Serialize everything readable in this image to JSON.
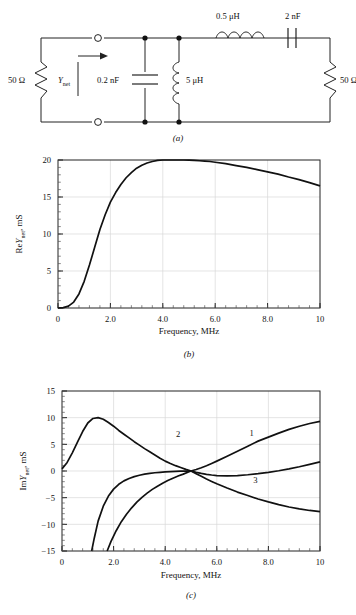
{
  "figure": {
    "panels": [
      {
        "id": "a",
        "caption": "(a)",
        "type": "circuit"
      },
      {
        "id": "b",
        "caption": "(b)",
        "type": "chart"
      },
      {
        "id": "c",
        "caption": "(c)",
        "type": "chart"
      }
    ]
  },
  "circuit": {
    "source_resistor_label": "50 Ω",
    "load_resistor_label": "50 Ω",
    "admittance_label": "Y",
    "admittance_sub": "net",
    "cap_shunt_label": "0.2 nF",
    "inductor_shunt_label": "5 μH",
    "inductor_series_label": "0.5 μH",
    "cap_series_label": "2 nF",
    "terminal_top": "terminal",
    "terminal_bottom": "terminal"
  },
  "chart_data": [
    {
      "panel": "b",
      "type": "line",
      "title": "",
      "xlabel": "Frequency, MHz",
      "ylabel_prefix": "Re",
      "ylabel_sym": "Y",
      "ylabel_sub": "net",
      "ylabel_units": ", mS",
      "ylabel": "Re Ynet, mS",
      "xlim": [
        0,
        10
      ],
      "ylim": [
        0,
        20
      ],
      "xticks": [
        0,
        2,
        4,
        6,
        8,
        10
      ],
      "xticklabels": [
        "0",
        "2.0",
        "4.0",
        "6.0",
        "8.0",
        "10"
      ],
      "yticks": [
        0,
        5,
        10,
        15,
        20
      ],
      "yticklabels": [
        "0",
        "5",
        "10",
        "15",
        "20"
      ],
      "grid": true,
      "minor_ticks": true,
      "series": [
        {
          "name": "ReYnet",
          "x": [
            0.0,
            0.2,
            0.4,
            0.6,
            0.8,
            1.0,
            1.2,
            1.4,
            1.6,
            1.8,
            2.0,
            2.2,
            2.4,
            2.6,
            2.8,
            3.0,
            3.2,
            3.4,
            3.6,
            3.8,
            4.0,
            4.2,
            4.4,
            4.6,
            4.8,
            5.0,
            5.2,
            5.4,
            5.6,
            5.8,
            6.0,
            6.4,
            6.8,
            7.2,
            7.6,
            8.0,
            8.4,
            8.8,
            9.2,
            9.6,
            10.0
          ],
          "y": [
            0.0,
            0.05,
            0.25,
            0.8,
            1.9,
            3.6,
            5.8,
            8.2,
            10.6,
            12.6,
            14.3,
            15.6,
            16.7,
            17.6,
            18.3,
            18.9,
            19.3,
            19.6,
            19.8,
            19.95,
            20.0,
            20.0,
            20.0,
            20.0,
            20.0,
            19.98,
            19.95,
            19.9,
            19.85,
            19.8,
            19.7,
            19.5,
            19.25,
            19.0,
            18.7,
            18.4,
            18.1,
            17.7,
            17.35,
            16.95,
            16.5
          ]
        }
      ]
    },
    {
      "panel": "c",
      "type": "line",
      "title": "",
      "xlabel": "Frequency, MHz",
      "ylabel_prefix": "Im",
      "ylabel_sym": "Y",
      "ylabel_sub": "net",
      "ylabel_units": ", mS",
      "ylabel": "Im Ynet, mS",
      "xlim": [
        0,
        10
      ],
      "ylim": [
        -15,
        15
      ],
      "xticks": [
        0,
        2,
        4,
        6,
        8,
        10
      ],
      "xticklabels": [
        "0",
        "2.0",
        "4.0",
        "6.0",
        "8.0",
        "10"
      ],
      "yticks": [
        -15,
        -10,
        -5,
        0,
        5,
        10,
        15
      ],
      "yticklabels": [
        "−15",
        "−10",
        "−5",
        "0",
        "5",
        "10",
        "15"
      ],
      "grid": true,
      "minor_ticks": true,
      "annotations": [
        {
          "text": "1",
          "x": 7.35,
          "y": 6.6
        },
        {
          "text": "2",
          "x": 4.5,
          "y": 6.4
        },
        {
          "text": "3",
          "x": 7.5,
          "y": -2.2
        }
      ],
      "series": [
        {
          "name": "1",
          "x": [
            1.15,
            1.25,
            1.4,
            1.6,
            1.8,
            2.0,
            2.2,
            2.4,
            2.6,
            2.8,
            3.0,
            3.2,
            3.4,
            3.6,
            3.8,
            4.0,
            4.2,
            4.4,
            4.6,
            4.8,
            5.0,
            5.2,
            5.4,
            5.6,
            5.8,
            6.0,
            6.4,
            6.8,
            7.2,
            7.6,
            8.0,
            8.4,
            8.8,
            9.2,
            9.6,
            10.0
          ],
          "y": [
            -15.0,
            -12.6,
            -9.4,
            -6.6,
            -4.7,
            -3.4,
            -2.5,
            -1.85,
            -1.4,
            -1.05,
            -0.8,
            -0.6,
            -0.45,
            -0.33,
            -0.24,
            -0.16,
            -0.1,
            -0.06,
            -0.03,
            -0.01,
            0.0,
            0.28,
            0.62,
            1.0,
            1.42,
            1.85,
            2.75,
            3.7,
            4.65,
            5.6,
            6.35,
            7.1,
            7.8,
            8.4,
            8.9,
            9.3
          ]
        },
        {
          "name": "2",
          "x": [
            0.0,
            0.2,
            0.4,
            0.6,
            0.8,
            1.0,
            1.2,
            1.4,
            1.6,
            1.8,
            2.0,
            2.2,
            2.4,
            2.6,
            2.8,
            3.0,
            3.2,
            3.4,
            3.6,
            3.8,
            4.0,
            4.2,
            4.4,
            4.6,
            4.8,
            5.0,
            5.2,
            5.4,
            5.6,
            5.8,
            6.0,
            6.4,
            6.8,
            7.2,
            7.6,
            8.0,
            8.4,
            8.8,
            9.2,
            9.6,
            10.0
          ],
          "y": [
            0.4,
            1.6,
            3.4,
            5.4,
            7.4,
            9.0,
            9.85,
            10.0,
            9.7,
            9.1,
            8.4,
            7.6,
            6.9,
            6.2,
            5.5,
            4.85,
            4.2,
            3.6,
            3.0,
            2.4,
            1.85,
            1.4,
            1.0,
            0.65,
            0.3,
            0.0,
            -0.25,
            -0.45,
            -0.62,
            -0.75,
            -0.85,
            -0.9,
            -0.85,
            -0.7,
            -0.5,
            -0.25,
            0.05,
            0.4,
            0.8,
            1.25,
            1.7
          ]
        },
        {
          "name": "3",
          "x": [
            1.75,
            1.9,
            2.1,
            2.3,
            2.5,
            2.7,
            2.9,
            3.1,
            3.3,
            3.5,
            3.7,
            3.9,
            4.1,
            4.3,
            4.5,
            4.7,
            4.9,
            5.0,
            5.2,
            5.4,
            5.6,
            5.8,
            6.0,
            6.4,
            6.8,
            7.2,
            7.6,
            8.0,
            8.4,
            8.8,
            9.2,
            9.6,
            10.0
          ],
          "y": [
            -15.0,
            -13.2,
            -11.2,
            -9.5,
            -8.1,
            -6.9,
            -5.85,
            -4.95,
            -4.15,
            -3.45,
            -2.85,
            -2.3,
            -1.8,
            -1.35,
            -0.95,
            -0.58,
            -0.18,
            0.0,
            -0.5,
            -1.0,
            -1.5,
            -1.95,
            -2.4,
            -3.2,
            -3.95,
            -4.6,
            -5.25,
            -5.8,
            -6.3,
            -6.75,
            -7.1,
            -7.4,
            -7.6
          ]
        }
      ]
    }
  ]
}
